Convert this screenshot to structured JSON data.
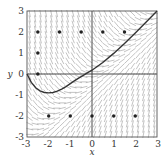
{
  "chart_data": {
    "type": "line",
    "subtype": "slope-field-with-solution-curve",
    "title": "",
    "xlabel": "x",
    "ylabel": "y",
    "xlim": [
      -3,
      3
    ],
    "ylim": [
      -3,
      3
    ],
    "grid": false,
    "x_ticks": [
      "-3",
      "-2",
      "-1",
      "0",
      "1",
      "2",
      "3"
    ],
    "y_ticks": [
      "3",
      "2",
      "1",
      "0",
      "-1",
      "-2",
      "-3"
    ],
    "slope_field": {
      "equation_shape": "dy/dx = x - y",
      "grid_step": 0.25,
      "segment_color": "#9a9a9a"
    },
    "solution_curve": {
      "color": "#333333",
      "points": [
        [
          -3.0,
          0.0
        ],
        [
          -2.8,
          -0.4
        ],
        [
          -2.6,
          -0.65
        ],
        [
          -2.4,
          -0.8
        ],
        [
          -2.2,
          -0.88
        ],
        [
          -2.0,
          -0.9
        ],
        [
          -1.8,
          -0.88
        ],
        [
          -1.6,
          -0.82
        ],
        [
          -1.4,
          -0.72
        ],
        [
          -1.2,
          -0.6
        ],
        [
          -1.0,
          -0.46
        ],
        [
          -0.8,
          -0.32
        ],
        [
          -0.6,
          -0.18
        ],
        [
          -0.4,
          -0.06
        ],
        [
          -0.2,
          0.06
        ],
        [
          0.0,
          0.18
        ],
        [
          0.5,
          0.55
        ],
        [
          1.0,
          0.98
        ],
        [
          1.5,
          1.45
        ],
        [
          2.0,
          1.95
        ],
        [
          2.5,
          2.47
        ],
        [
          3.0,
          3.0
        ]
      ]
    },
    "marked_points": [
      [
        -2.5,
        2
      ],
      [
        -1.5,
        2
      ],
      [
        -0.5,
        2
      ],
      [
        0.5,
        2
      ],
      [
        1.5,
        2
      ],
      [
        -2.5,
        1
      ],
      [
        -2.5,
        0
      ],
      [
        -2,
        -2
      ],
      [
        -1,
        -2
      ],
      [
        0,
        -2
      ],
      [
        1,
        -2
      ],
      [
        2,
        -2
      ]
    ]
  }
}
